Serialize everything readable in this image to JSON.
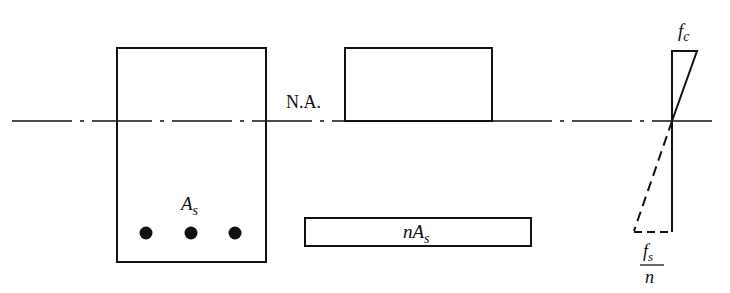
{
  "diagram": {
    "labels": {
      "neutral_axis": "N.A.",
      "steel_area_main": "A",
      "steel_area_sub": "s",
      "transformed_coef": "n",
      "transformed_main": "A",
      "transformed_sub": "s",
      "concrete_stress_main": "f",
      "concrete_stress_sub": "c",
      "steel_stress_num_main": "f",
      "steel_stress_num_sub": "s",
      "steel_stress_den": "n"
    },
    "elements": [
      {
        "id": "beam-section",
        "desc": "Rectangular concrete beam cross-section with three reinforcing bars"
      },
      {
        "id": "transformed-compression-area",
        "desc": "Compression zone rectangle above neutral axis"
      },
      {
        "id": "transformed-steel-area",
        "desc": "Transformed steel area rectangle nA_s"
      },
      {
        "id": "stress-diagram",
        "desc": "Linear stress distribution: f_c at top, f_s/n at steel level (dashed)"
      }
    ],
    "colors": {
      "stroke": "#111111",
      "background": "#ffffff"
    }
  }
}
